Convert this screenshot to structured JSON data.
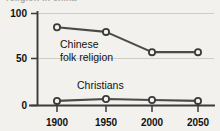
{
  "clipped_title": "religion in china",
  "chart_data": {
    "type": "line",
    "title": "",
    "xlabel": "",
    "ylabel": "",
    "x": [
      1900,
      1950,
      2000,
      2050
    ],
    "categories": [
      "1900",
      "1950",
      "2000",
      "2050"
    ],
    "series": [
      {
        "name": "Chinese folk religion",
        "label_line1": "Chinese",
        "label_line2": "folk religion",
        "values": [
          85,
          80,
          58,
          58
        ]
      },
      {
        "name": "Christians",
        "label_line1": "Christians",
        "label_line2": "",
        "values": [
          5,
          7,
          6,
          5
        ]
      }
    ],
    "ylim": [
      0,
      100
    ],
    "yticks": [
      0,
      50,
      100
    ],
    "ytick_labels": [
      "0",
      "50",
      "100"
    ],
    "xtick_labels": [
      "1900",
      "1950",
      "2000",
      "2050"
    ],
    "grid": true,
    "legend_position": "inline-labels",
    "colors": {
      "background": "#f2f1ee",
      "line": "#4a4a4a",
      "axis": "#3a3a3a",
      "grid": "#c9c7c2",
      "marker_fill": "#f4f3f0",
      "text": "#111111"
    }
  }
}
